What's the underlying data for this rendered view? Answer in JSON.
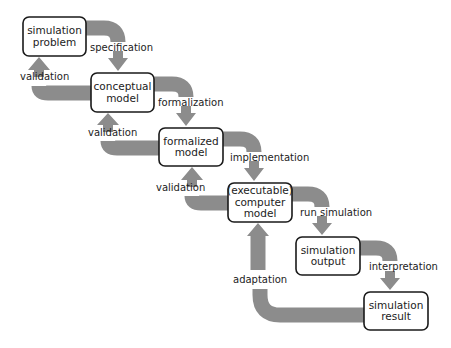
{
  "diagram": {
    "colors": {
      "arrow": "#8c8c8c",
      "box_border": "#1a1a1a",
      "text": "#222222",
      "background": "#ffffff"
    },
    "nodes": [
      {
        "id": "simulation-problem",
        "lines": [
          "simulation",
          "problem"
        ],
        "x": 23,
        "y": 17,
        "w": 63,
        "h": 39
      },
      {
        "id": "conceptual-model",
        "lines": [
          "conceptual",
          "model"
        ],
        "x": 91,
        "y": 73,
        "w": 63,
        "h": 39
      },
      {
        "id": "formalized-model",
        "lines": [
          "formalized",
          "model"
        ],
        "x": 159,
        "y": 128,
        "w": 64,
        "h": 38
      },
      {
        "id": "executable-computer-model",
        "lines": [
          "(executable)",
          "computer",
          "model"
        ],
        "x": 228,
        "y": 183,
        "w": 64,
        "h": 39
      },
      {
        "id": "simulation-output",
        "lines": [
          "simulation",
          "output"
        ],
        "x": 296,
        "y": 237,
        "w": 64,
        "h": 38
      },
      {
        "id": "simulation-result",
        "lines": [
          "simulation",
          "result"
        ],
        "x": 364,
        "y": 292,
        "w": 64,
        "h": 38
      }
    ],
    "forward_edges": [
      {
        "label": "specification",
        "label_x": 90,
        "label_y": 51,
        "path": "M 86 28 L 104 28 Q 118 28 118 42",
        "head": [
          108,
          58,
          128,
          58,
          118,
          71
        ]
      },
      {
        "label": "formalization",
        "label_x": 158,
        "label_y": 106,
        "path": "M 154 84 L 172 84 Q 186 84 186 97",
        "head": [
          176,
          113,
          196,
          113,
          186,
          126
        ]
      },
      {
        "label": "implementation",
        "label_x": 230,
        "label_y": 161,
        "path": "M 223 139 L 240 139 Q 254 139 254 152",
        "head": [
          244,
          168,
          264,
          168,
          254,
          181
        ]
      },
      {
        "label": "run simulation",
        "label_x": 300,
        "label_y": 216,
        "path": "M 292 194 L 308 194 Q 322 194 322 207",
        "head": [
          312,
          223,
          332,
          223,
          322,
          235
        ]
      },
      {
        "label": "interpretation",
        "label_x": 369,
        "label_y": 270,
        "path": "M 360 248 L 376 248 Q 390 248 390 261",
        "head": [
          380,
          278,
          400,
          278,
          390,
          290
        ]
      }
    ],
    "feedback_edges": [
      {
        "label": "validation",
        "label_x": 20,
        "label_y": 80,
        "path": "M 91 93 L 48 93 Q 39 93 39 86",
        "head": [
          28,
          70,
          50,
          70,
          39,
          57
        ]
      },
      {
        "label": "validation",
        "label_x": 88,
        "label_y": 136,
        "path": "M 159 148 L 117 148 Q 108 148 108 141",
        "head": [
          97,
          125,
          119,
          125,
          108,
          113
        ]
      },
      {
        "label": "validation",
        "label_x": 156,
        "label_y": 191,
        "path": "M 228 203 L 201 203 Q 192 203 192 196",
        "head": [
          181,
          180,
          203,
          180,
          192,
          167
        ]
      }
    ],
    "adaptation_edge": {
      "label": "adaptation",
      "label_x": 233,
      "label_y": 283,
      "path_lower": "M 364 315 L 280 315 Q 260 315 260 295 L 260 289",
      "path_upper": "M 258 270 L 258 234",
      "head": [
        247,
        236,
        269,
        236,
        258,
        223
      ]
    }
  }
}
